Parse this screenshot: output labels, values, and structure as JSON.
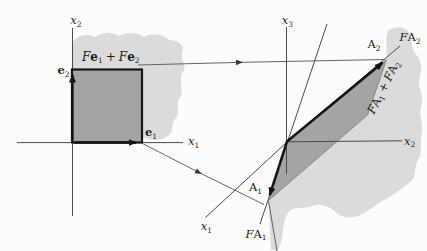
{
  "figure_type": "linear-transformation-diagram",
  "colors": {
    "background": "#fcfcfa",
    "shaded_region": "#dbdbd9",
    "square_and_parallelogram_fill": "#a4a4a2",
    "thin_line": "#4a4a4a",
    "bold_line": "#151515"
  },
  "left_figure": {
    "axis_x1": {
      "base": "x",
      "sub": "1"
    },
    "axis_x2": {
      "base": "x",
      "sub": "2"
    },
    "e1": {
      "base": "e",
      "sub": "1"
    },
    "e2": {
      "base": "e",
      "sub": "2"
    },
    "sum_label": {
      "F1": "F",
      "e1": "e",
      "s1": "1",
      "plus": "+",
      "F2": "F",
      "e2": "e",
      "s2": "2"
    }
  },
  "right_figure": {
    "axis_x1": {
      "base": "x",
      "sub": "1"
    },
    "axis_x2": {
      "base": "x",
      "sub": "2"
    },
    "axis_x3": {
      "base": "x",
      "sub": "3"
    },
    "A1": {
      "base": "A",
      "sub": "1"
    },
    "A2": {
      "base": "A",
      "sub": "2"
    },
    "FA1": {
      "F": "F",
      "A": "A",
      "s": "1"
    },
    "FA2": {
      "F": "F",
      "A": "A",
      "s": "2"
    },
    "sum_label": {
      "F1": "F",
      "A1": "A",
      "s1": "1",
      "plus": "+",
      "F2": "F",
      "A2": "A",
      "s2": "2"
    }
  }
}
